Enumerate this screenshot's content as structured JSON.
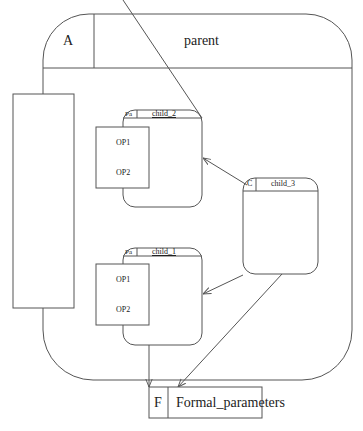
{
  "diagram": {
    "parent": {
      "tag": "A",
      "name": "parent"
    },
    "children": [
      {
        "id": "child_2",
        "tag": "Pa",
        "name": "child_2",
        "ops": [
          "OP1",
          "OP2"
        ]
      },
      {
        "id": "child_1",
        "tag": "Pa",
        "name": "child_1",
        "ops": [
          "OP1",
          "OP2"
        ]
      },
      {
        "id": "child_3",
        "tag": "C",
        "name": "child_3"
      }
    ],
    "formal": {
      "tag": "F",
      "name": "Formal_parameters"
    },
    "edges": [
      {
        "from": "child_3",
        "to": "child_2"
      },
      {
        "from": "child_3",
        "to": "child_1"
      },
      {
        "from": "child_3",
        "to": "Formal_parameters"
      },
      {
        "from": "child_1",
        "to": "Formal_parameters"
      }
    ],
    "colors": {
      "stroke": "#555555",
      "text": "#222222"
    }
  }
}
